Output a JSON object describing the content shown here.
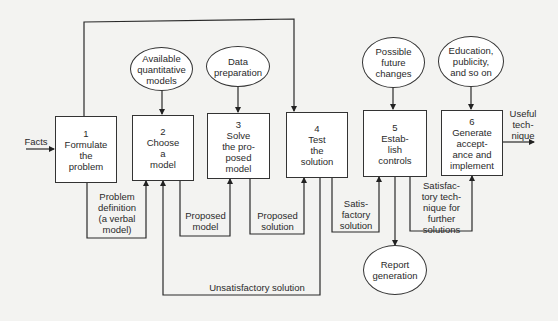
{
  "diagram": {
    "type": "flowchart",
    "input_label": "Facts",
    "output_label": "Useful\ntech-\nnique",
    "steps": [
      {
        "number": "1",
        "label": "1\nFormulate\nthe\nproblem"
      },
      {
        "number": "2",
        "label": "2\nChoose\na\nmodel"
      },
      {
        "number": "3",
        "label": "3\nSolve\nthe pro-\nposed\nmodel"
      },
      {
        "number": "4",
        "label": "4\nTest\nthe\nsolution"
      },
      {
        "number": "5",
        "label": "5\nEstab-\nlish\ncontrols"
      },
      {
        "number": "6",
        "label": "6\nGenerate\naccept-\nance and\nimplement"
      }
    ],
    "inputs": [
      {
        "label": "Available\nquantitative\nmodels",
        "target_step": "2"
      },
      {
        "label": "Data\npreparation",
        "target_step": "3"
      },
      {
        "label": "Possible\nfuture\nchanges",
        "target_step": "5"
      },
      {
        "label": "Education,\npublicity,\nand so on",
        "target_step": "6"
      }
    ],
    "outputs": [
      {
        "label": "Report\ngeneration",
        "source_step": "5"
      }
    ],
    "feedback_loops": [
      {
        "label": "Problem\ndefinition\n(a verbal\nmodel)",
        "from": "1",
        "to": "2"
      },
      {
        "label": "Proposed\nmodel",
        "from": "2",
        "to": "3"
      },
      {
        "label": "Proposed\nsolution",
        "from": "3",
        "to": "4"
      },
      {
        "label": "Satis-\nfactory\nsolution",
        "from": "4",
        "to": "5"
      },
      {
        "label": "Satisfac-\ntory tech-\nnique for\nfurther\nsolutions",
        "from": "5",
        "to": "6"
      },
      {
        "label": "Unsatisfactory solution",
        "from": "4",
        "to": "2"
      }
    ],
    "top_connector": {
      "from": "1",
      "to": "4"
    }
  }
}
